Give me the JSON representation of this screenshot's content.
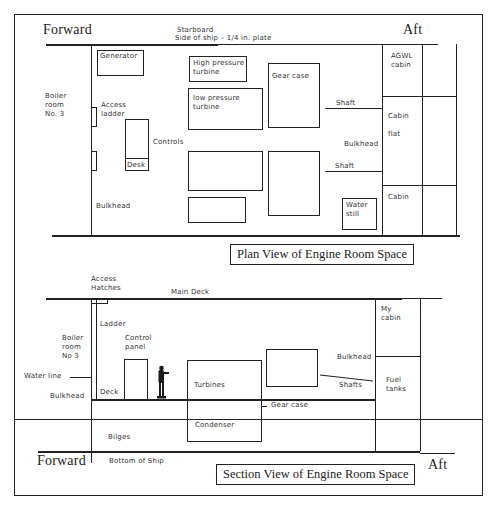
{
  "plan_view": {
    "title": "Plan View of  Engine Room Space",
    "forward": "Forward",
    "aft": "Aft",
    "starboard": "Starboard",
    "side_of_ship": "Side of ship – 1/4 in. plate",
    "boiler_room": "Boiler\nroom\nNo. 3",
    "generator": "Generator",
    "access_ladder": "Access\nladder",
    "desk": "Desk",
    "controls": "Controls",
    "bulkhead_left": "Bulkhead",
    "high_pressure_turbine": "High pressure\nturbine",
    "low_pressure_turbine": "low pressure\nturbine",
    "gear_case": "Gear case",
    "shaft_upper": "Shaft",
    "shaft_lower": "Shaft",
    "bulkhead_right": "Bulkhead",
    "water_still": "Water\nstill",
    "agwl_cabin": "AGWL\ncabin",
    "cabin_flat": "Cabin\n\nflat",
    "cabin": "Cabin"
  },
  "section_view": {
    "title": "Section View of Engine Room Space",
    "forward": "Forward",
    "aft": "Aft",
    "access_hatches": "Access\nHatches",
    "main_deck": "Main Deck",
    "ladder": "Ladder",
    "boiler_room": "Boiler\nroom\nNo 3",
    "water_line": "Water line",
    "bulkhead_left": "Bulkhead",
    "deck": "Deck",
    "control_panel": "Control\npanel",
    "turbines": "Turbines",
    "condenser": "Condenser",
    "gear_case": "Gear case",
    "shafts": "Shafts",
    "bulkhead_right": "Bulkhead",
    "my_cabin": "My\ncabin",
    "fuel_tanks": "Fuel\ntanks",
    "bilges": "Bilges",
    "bottom_of_ship": "Bottom of Ship"
  },
  "colors": {
    "ink": "#222222",
    "background": "#ffffff"
  }
}
